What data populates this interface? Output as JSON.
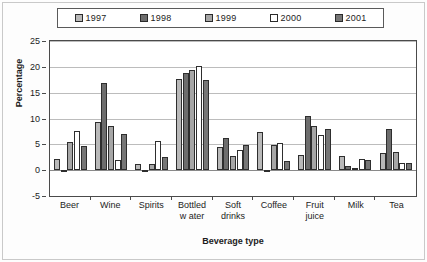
{
  "chart_data": {
    "type": "bar",
    "title": "",
    "xlabel": "Beverage type",
    "ylabel": "Percentage",
    "ylim": [
      -5,
      25
    ],
    "yticks": [
      25,
      20,
      15,
      10,
      5,
      0,
      -5
    ],
    "grid": true,
    "legend_position": "top",
    "categories": [
      "Beer",
      "Wine",
      "Spirits",
      "Bottled w ater",
      "Soft drinks",
      "Coffee",
      "Fruit juice",
      "Milk",
      "Tea"
    ],
    "category_lines": [
      [
        "Beer",
        ""
      ],
      [
        "Wine",
        ""
      ],
      [
        "Spirits",
        ""
      ],
      [
        "Bottled",
        "w ater"
      ],
      [
        "Soft",
        "drinks"
      ],
      [
        "Coffee",
        ""
      ],
      [
        "Fruit",
        "juice"
      ],
      [
        "Milk",
        ""
      ],
      [
        "Tea",
        ""
      ]
    ],
    "series": [
      {
        "name": "1997",
        "color": "#b9b9b9",
        "values": [
          2.2,
          9.4,
          1.2,
          17.7,
          4.4,
          7.3,
          2.9,
          2.7,
          3.4
        ]
      },
      {
        "name": "1998",
        "color": "#6d6d6d",
        "values": [
          -0.3,
          16.9,
          0.1,
          18.8,
          6.3,
          0.05,
          10.4,
          0.8,
          7.9
        ]
      },
      {
        "name": "1999",
        "color": "#a6a6a6",
        "values": [
          5.4,
          8.6,
          1.2,
          19.4,
          2.8,
          4.8,
          8.6,
          0.5,
          3.6
        ]
      },
      {
        "name": "2000",
        "color": "#ffffff",
        "values": [
          7.5,
          2.0,
          5.6,
          20.1,
          3.9,
          5.2,
          6.8,
          2.2,
          1.4
        ]
      },
      {
        "name": "2001",
        "color": "#767676",
        "values": [
          4.6,
          7.0,
          2.5,
          17.4,
          4.8,
          1.7,
          7.9,
          1.9,
          1.4
        ]
      }
    ]
  },
  "legend": {
    "items": [
      {
        "label": "1997"
      },
      {
        "label": "1998"
      },
      {
        "label": "1999"
      },
      {
        "label": "2000"
      },
      {
        "label": "2001"
      }
    ]
  },
  "axes": {
    "y_title": "Percentage",
    "x_title": "Beverage type",
    "y_tick_labels": [
      "25",
      "20",
      "15",
      "10",
      "5",
      "0",
      "-5"
    ]
  }
}
